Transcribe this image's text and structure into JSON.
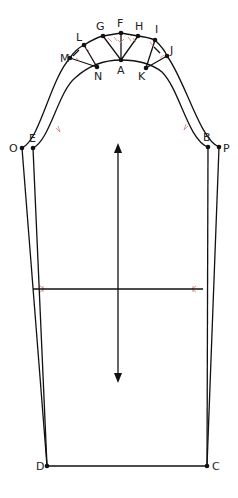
{
  "diagram": {
    "type": "sleeve-pattern-draft",
    "points": {
      "A": {
        "label": "A",
        "x": 121,
        "y": 60
      },
      "B": {
        "label": "B",
        "x": 208,
        "y": 147
      },
      "C": {
        "label": "C",
        "x": 207,
        "y": 466
      },
      "D": {
        "label": "D",
        "x": 47,
        "y": 466
      },
      "E": {
        "label": "E",
        "x": 33,
        "y": 148
      },
      "F": {
        "label": "F",
        "x": 121,
        "y": 33
      },
      "G": {
        "label": "G",
        "x": 103,
        "y": 36
      },
      "H": {
        "label": "H",
        "x": 138,
        "y": 36
      },
      "I": {
        "label": "I",
        "x": 155,
        "y": 40
      },
      "J": {
        "label": "J",
        "x": 167,
        "y": 56
      },
      "K": {
        "label": "K",
        "x": 146,
        "y": 68
      },
      "L": {
        "label": "L",
        "x": 84,
        "y": 45
      },
      "M": {
        "label": "M",
        "x": 70,
        "y": 58
      },
      "N": {
        "label": "N",
        "x": 97,
        "y": 67
      },
      "O": {
        "label": "O",
        "x": 22,
        "y": 148
      },
      "P": {
        "label": "P",
        "x": 219,
        "y": 147
      }
    },
    "grainline": {
      "name": "grain-arrow",
      "x": 118,
      "y1": 143,
      "y2": 383
    },
    "bicep_line": {
      "y": 289,
      "x1": 33,
      "x2": 203
    },
    "colors": {
      "line": "#111111",
      "marker": "#d98a7a",
      "background": "#ffffff"
    }
  }
}
